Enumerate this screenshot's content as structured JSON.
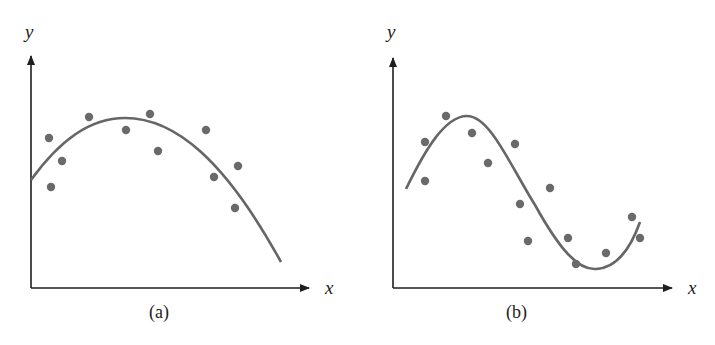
{
  "colors": {
    "axis": "#1e1e1e",
    "curve": "#666666",
    "points": "#6a6a6a",
    "background": "#ffffff"
  },
  "chart_data": [
    {
      "type": "scatter",
      "panel": "a",
      "caption": "(a)",
      "xlabel": "x",
      "ylabel": "y",
      "grid": false,
      "ticks": false,
      "description": "Scatter points with fitted quadratic (concave-down parabola) curve",
      "fit": "quadratic",
      "points_px": [
        [
          49,
          138
        ],
        [
          51,
          187
        ],
        [
          62,
          161
        ],
        [
          89,
          117
        ],
        [
          126,
          130
        ],
        [
          150,
          114
        ],
        [
          158,
          151
        ],
        [
          206,
          130
        ],
        [
          214,
          177
        ],
        [
          238,
          166
        ],
        [
          235,
          208
        ]
      ],
      "curve_px": "M31,180 C60,140 90,118 125,118 C175,118 225,160 281,262"
    },
    {
      "type": "scatter",
      "panel": "b",
      "caption": "(b)",
      "xlabel": "x",
      "ylabel": "y",
      "grid": false,
      "ticks": false,
      "description": "Scatter points with fitted cubic (S-shaped) curve",
      "fit": "cubic",
      "points_px": [
        [
          425,
          142
        ],
        [
          425,
          181
        ],
        [
          446,
          116
        ],
        [
          472,
          133
        ],
        [
          488,
          163
        ],
        [
          515,
          144
        ],
        [
          520,
          204
        ],
        [
          528,
          241
        ],
        [
          550,
          188
        ],
        [
          568,
          238
        ],
        [
          576,
          264
        ],
        [
          606,
          253
        ],
        [
          632,
          217
        ],
        [
          640,
          238
        ]
      ],
      "curve_px": "M406,189 C425,150 445,116 467,116 C490,116 510,165 535,205 C560,250 578,270 596,269 C615,268 630,250 640,222"
    }
  ],
  "panels": [
    {
      "caption": "(a)",
      "xlabel": "x",
      "ylabel": "y"
    },
    {
      "caption": "(b)",
      "xlabel": "x",
      "ylabel": "y"
    }
  ]
}
